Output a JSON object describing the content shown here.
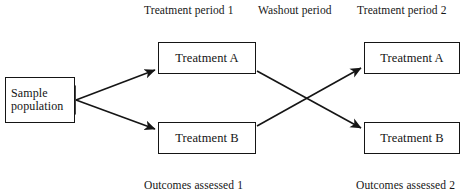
{
  "diagram": {
    "type": "crossover-trial-flow",
    "width": 469,
    "height": 196,
    "background_color": "#ffffff",
    "line_color": "#151515",
    "text_color": "#141414"
  },
  "captions": {
    "treatment_period_1": "Treatment period 1",
    "washout_period": "Washout period",
    "treatment_period_2": "Treatment period 2",
    "outcomes_assessed_1": "Outcomes assessed 1",
    "outcomes_assessed_2": "Outcomes assessed 2"
  },
  "nodes": {
    "sample_population": "Sample\npopulation",
    "sample_population_line_1": "Sample",
    "sample_population_line_2": "population",
    "period1_treatment_a": "Treatment A",
    "period1_treatment_b": "Treatment B",
    "period2_treatment_a": "Treatment A",
    "period2_treatment_b": "Treatment B"
  },
  "edges": [
    {
      "name": "sample-to-period1-treatment-a",
      "from": "sample_population",
      "to": "period1_treatment_a",
      "arrowhead": "end"
    },
    {
      "name": "sample-to-period1-treatment-b",
      "from": "sample_population",
      "to": "period1_treatment_b",
      "arrowhead": "end"
    },
    {
      "name": "period1-treatment-a-to-period2-treatment-b",
      "from": "period1_treatment_a",
      "to": "period2_treatment_b",
      "arrowhead": "end"
    },
    {
      "name": "period1-treatment-b-to-period2-treatment-a",
      "from": "period1_treatment_b",
      "to": "period2_treatment_a",
      "arrowhead": "end"
    }
  ]
}
